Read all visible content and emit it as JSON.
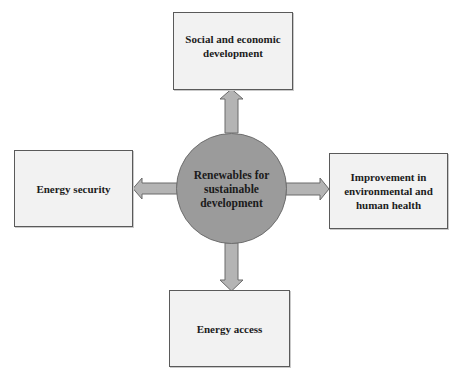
{
  "diagram": {
    "type": "hub-and-spoke",
    "center": {
      "label": "Renewables for sustainable development",
      "lines": [
        "Renewables for",
        "sustainable",
        "development"
      ],
      "fill": "#9b9b9b"
    },
    "nodes": {
      "top": {
        "label": "Social and economic development",
        "lines": [
          "Social and economic",
          "development"
        ]
      },
      "left": {
        "label": "Energy security",
        "lines": [
          "Energy security"
        ]
      },
      "right": {
        "label": "Improvement in environmental and human health",
        "lines": [
          "Improvement in",
          "environmental and",
          "human health"
        ]
      },
      "bottom": {
        "label": "Energy access",
        "lines": [
          "Energy access"
        ]
      }
    },
    "edges": [
      {
        "from": "center",
        "to": "top",
        "direction": "up"
      },
      {
        "from": "center",
        "to": "left",
        "direction": "left"
      },
      {
        "from": "center",
        "to": "right",
        "direction": "right"
      },
      {
        "from": "center",
        "to": "bottom",
        "direction": "down"
      }
    ],
    "colors": {
      "box_fill": "#f2f2f2",
      "box_border": "#5a5a5a",
      "arrow_fill": "#b4b4b4",
      "arrow_stroke": "#6a6a6a",
      "text": "#1c1c1c"
    }
  }
}
